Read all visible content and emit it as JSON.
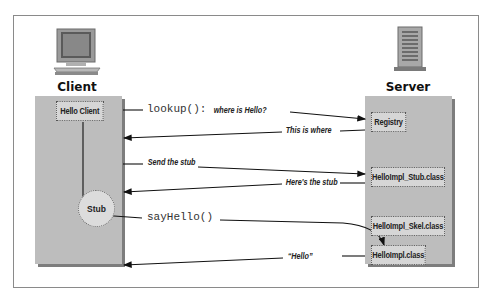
{
  "diagram": {
    "client": {
      "title": "Client",
      "icon": "computer-monitor-icon",
      "boxes": {
        "hello_client": "Hello Client",
        "stub": "Stub"
      }
    },
    "server": {
      "title": "Server",
      "icon": "server-tower-icon",
      "boxes": {
        "registry": "Registry",
        "stub_class": "HelloImpl_Stub.class",
        "skel_class": "HelloImpl_Skel.class",
        "impl_class": "HelloImpl.class"
      }
    },
    "messages": {
      "lookup_code": "lookup():",
      "lookup_text": "where is Hello?",
      "this_is_where": "This is where",
      "send_stub": "Send the stub",
      "heres_stub": "Here's the stub",
      "say_hello": "sayHello()",
      "hello_reply": "“Hello”"
    },
    "colors": {
      "column_fill": "#bdbdbd",
      "column_shadow": "#7d7d7d",
      "box_fill": "#d6d6d6",
      "line": "#111111"
    }
  }
}
